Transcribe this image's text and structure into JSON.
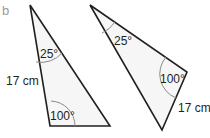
{
  "part_label": "b",
  "triangles": [
    {
      "name": "left-triangle",
      "angle_top": "25°",
      "angle_bottom": "100°",
      "side_label": "17 cm"
    },
    {
      "name": "right-triangle",
      "angle_top": "25°",
      "angle_right": "100°",
      "side_label": "17 cm"
    }
  ],
  "colors": {
    "stroke": "#231f20",
    "fill": "#f6f6f6",
    "arc": "#8a8a8a"
  }
}
